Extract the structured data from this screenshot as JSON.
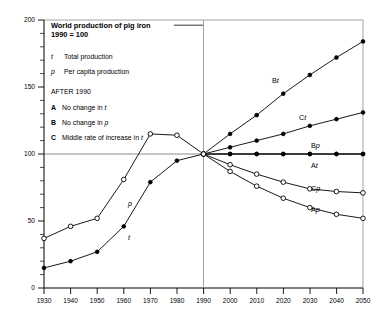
{
  "chart_data": {
    "type": "line",
    "title": "World production of pig iron",
    "subtitle": "1990 = 100",
    "xlabel": "",
    "ylabel": "",
    "xlim": [
      1930,
      2050
    ],
    "ylim": [
      0,
      200
    ],
    "xticks": [
      1930,
      1940,
      1950,
      1960,
      1970,
      1980,
      1990,
      2000,
      2010,
      2020,
      2030,
      2040,
      2050
    ],
    "yticks": [
      0,
      50,
      100,
      150,
      200
    ],
    "yminor_step": 10,
    "grid": "y=100 reference line and vertical divider at 1990",
    "legend_position": "upper-left inside plot",
    "reference_year": 1990,
    "reference_value": 100,
    "series": [
      {
        "name": "t",
        "label": "t",
        "description": "Total production (historical)",
        "marker": "filled-circle",
        "x": [
          1930,
          1940,
          1950,
          1960,
          1970,
          1980,
          1990
        ],
        "values": [
          15,
          20,
          27,
          46,
          79,
          95,
          100
        ]
      },
      {
        "name": "p",
        "label": "p",
        "description": "Per capita production (historical)",
        "marker": "open-circle",
        "x": [
          1930,
          1940,
          1950,
          1960,
          1970,
          1980,
          1990
        ],
        "values": [
          37,
          46,
          52,
          81,
          115,
          114,
          100
        ]
      },
      {
        "name": "Bt",
        "label": "Bt",
        "description": "Scenario B total production - no change in p",
        "marker": "filled-circle",
        "x": [
          1990,
          2000,
          2010,
          2020,
          2030,
          2040,
          2050
        ],
        "values": [
          100,
          115,
          129,
          145,
          159,
          172,
          184
        ]
      },
      {
        "name": "Ct",
        "label": "Ct",
        "description": "Scenario C total production - middle rate of increase in t",
        "marker": "filled-circle",
        "x": [
          1990,
          2000,
          2010,
          2020,
          2030,
          2040,
          2050
        ],
        "values": [
          100,
          105,
          110,
          115,
          121,
          126,
          131
        ]
      },
      {
        "name": "Bp",
        "label": "Bp",
        "description": "Scenario B per capita production - no change in p",
        "marker": "filled-circle",
        "x": [
          1990,
          2000,
          2010,
          2020,
          2030,
          2040,
          2050
        ],
        "values": [
          100,
          100,
          100,
          100,
          100,
          100,
          100
        ]
      },
      {
        "name": "At",
        "label": "At",
        "description": "Scenario A total production - no change in t",
        "marker": "filled-circle",
        "x": [
          1990,
          2000,
          2010,
          2020,
          2030,
          2040,
          2050
        ],
        "values": [
          100,
          100,
          100,
          100,
          100,
          100,
          100
        ]
      },
      {
        "name": "Cp",
        "label": "Cp",
        "description": "Scenario C per capita production",
        "marker": "open-circle",
        "x": [
          1990,
          2000,
          2010,
          2020,
          2030,
          2040,
          2050
        ],
        "values": [
          100,
          92,
          85,
          79,
          74,
          72,
          71
        ]
      },
      {
        "name": "Ap",
        "label": "Ap",
        "description": "Scenario A per capita production",
        "marker": "open-circle",
        "x": [
          1990,
          2000,
          2010,
          2020,
          2030,
          2040,
          2050
        ],
        "values": [
          100,
          87,
          76,
          67,
          60,
          55,
          52
        ]
      }
    ],
    "annotations": [
      {
        "text": "Bt",
        "x": 2016,
        "y": 151
      },
      {
        "text": "Ct",
        "x": 2026,
        "y": 124
      },
      {
        "text": "Bp",
        "x": 2030,
        "y": 107
      },
      {
        "text": "At",
        "x": 2030,
        "y": 94
      },
      {
        "text": "Cp",
        "x": 2030,
        "y": 80
      },
      {
        "text": "Ap",
        "x": 2030,
        "y": 67
      },
      {
        "text": "p",
        "x": 1963,
        "y": 74
      },
      {
        "text": "t",
        "x": 1963,
        "y": 55
      }
    ]
  },
  "legend": {
    "entries": [
      {
        "key": "t",
        "key_style": "italic",
        "text": "Total production"
      },
      {
        "key": "p",
        "key_style": "italic",
        "text": "Per capita production"
      }
    ],
    "section_heading": "AFTER 1990",
    "scenarios": [
      {
        "key": "A",
        "text_before": "No change in ",
        "text_italic": "t"
      },
      {
        "key": "B",
        "text_before": "No change in ",
        "text_italic": "p"
      },
      {
        "key": "C",
        "text_before": "Middle rate of increase in ",
        "text_italic": "t"
      }
    ]
  },
  "axis_labels": {
    "x": [
      "1930",
      "1940",
      "1950",
      "1960",
      "1970",
      "1980",
      "1990",
      "2000",
      "2010",
      "2020",
      "2030",
      "2040",
      "2050"
    ],
    "y": [
      "0",
      "50",
      "100",
      "150",
      "200"
    ]
  },
  "colors": {
    "ink": "#000000",
    "frame": "#8a8a8a",
    "background": "#ffffff"
  }
}
